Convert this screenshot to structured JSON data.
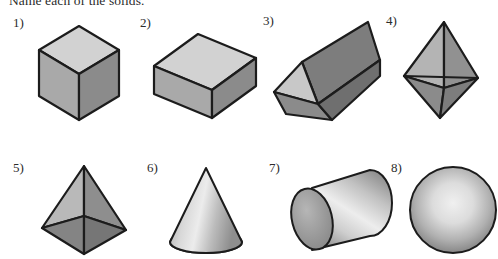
{
  "worksheet": {
    "prompt": "Name each of the solids.",
    "background_color": "#ffffff",
    "ink_color": "#2b2b2b"
  },
  "palette": {
    "face_light": "#d2d2d2",
    "face_mid": "#a9a9a9",
    "face_dark": "#8b8b8b",
    "face_darker": "#7d7d7d",
    "outline": "#1c1c1c",
    "highlight": "#ececec"
  },
  "items": [
    {
      "number": "1)",
      "shape_name": "cube",
      "label_x": 13,
      "label_y": 15,
      "fig_x": 33,
      "fig_y": 24,
      "fig_w": 92,
      "fig_h": 98
    },
    {
      "number": "2)",
      "shape_name": "rectangular-prism",
      "label_x": 140,
      "label_y": 15,
      "fig_x": 150,
      "fig_y": 30,
      "fig_w": 110,
      "fig_h": 92
    },
    {
      "number": "3)",
      "shape_name": "triangular-prism",
      "label_x": 263,
      "label_y": 13,
      "fig_x": 272,
      "fig_y": 18,
      "fig_w": 110,
      "fig_h": 104
    },
    {
      "number": "4)",
      "shape_name": "octahedron",
      "label_x": 386,
      "label_y": 13,
      "fig_x": 400,
      "fig_y": 20,
      "fig_w": 82,
      "fig_h": 100
    },
    {
      "number": "5)",
      "shape_name": "square-pyramid",
      "label_x": 13,
      "label_y": 160,
      "fig_x": 38,
      "fig_y": 164,
      "fig_w": 92,
      "fig_h": 92
    },
    {
      "number": "6)",
      "shape_name": "cone",
      "label_x": 147,
      "label_y": 160,
      "fig_x": 167,
      "fig_y": 166,
      "fig_w": 78,
      "fig_h": 90
    },
    {
      "number": "7)",
      "shape_name": "cylinder",
      "label_x": 269,
      "label_y": 160,
      "fig_x": 282,
      "fig_y": 166,
      "fig_w": 110,
      "fig_h": 90
    },
    {
      "number": "8)",
      "shape_name": "sphere",
      "label_x": 391,
      "label_y": 160,
      "fig_x": 408,
      "fig_y": 164,
      "fig_w": 90,
      "fig_h": 92
    }
  ]
}
